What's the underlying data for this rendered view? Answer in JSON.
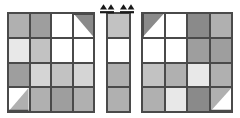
{
  "figure": {
    "background": "#ffffff",
    "line_color": "#4a4a4a",
    "palette": {
      "white": "#ffffff",
      "very_light_gray": "#e8e8e8",
      "light_gray": "#d5d5d5",
      "medium_light_gray": "#c2c2c2",
      "medium_gray": "#b0b0b0",
      "medium_dark_gray": "#9e9e9e",
      "dark_gray": "#8a8a8a"
    }
  },
  "markers": {
    "arrow_left_label": "seam-alignment-arrow",
    "arrow_right_label": "seam-alignment-arrow",
    "count": 2
  },
  "panels": [
    {
      "id": "panel-left",
      "name": "left-block",
      "columns": 4,
      "rows": 4,
      "cells": [
        {
          "fill": "#b0b0b0",
          "shape": "solid"
        },
        {
          "fill": "#9e9e9e",
          "shape": "solid"
        },
        {
          "fill": "#ffffff",
          "shape": "solid"
        },
        {
          "fill": "#ffffff",
          "shape": "triangle-top-right",
          "tri_fill": "#8a8a8a"
        },
        {
          "fill": "#e8e8e8",
          "shape": "solid"
        },
        {
          "fill": "#c2c2c2",
          "shape": "solid"
        },
        {
          "fill": "#ffffff",
          "shape": "solid"
        },
        {
          "fill": "#ffffff",
          "shape": "solid"
        },
        {
          "fill": "#9e9e9e",
          "shape": "solid"
        },
        {
          "fill": "#d5d5d5",
          "shape": "solid"
        },
        {
          "fill": "#c2c2c2",
          "shape": "solid"
        },
        {
          "fill": "#d5d5d5",
          "shape": "solid"
        },
        {
          "fill": "#ffffff",
          "shape": "triangle-bottom-right",
          "tri_fill": "#b0b0b0"
        },
        {
          "fill": "#b0b0b0",
          "shape": "solid"
        },
        {
          "fill": "#9e9e9e",
          "shape": "solid"
        },
        {
          "fill": "#b0b0b0",
          "shape": "solid"
        }
      ]
    },
    {
      "id": "panel-middle",
      "name": "center-sashing-strip",
      "columns": 1,
      "rows": 4,
      "cells": [
        {
          "fill": "#c2c2c2",
          "shape": "solid"
        },
        {
          "fill": "#ffffff",
          "shape": "solid"
        },
        {
          "fill": "#b0b0b0",
          "shape": "solid"
        },
        {
          "fill": "#b0b0b0",
          "shape": "solid"
        }
      ]
    },
    {
      "id": "panel-right",
      "name": "right-block",
      "columns": 4,
      "rows": 4,
      "cells": [
        {
          "fill": "#ffffff",
          "shape": "triangle-top-left",
          "tri_fill": "#8a8a8a"
        },
        {
          "fill": "#ffffff",
          "shape": "solid"
        },
        {
          "fill": "#8a8a8a",
          "shape": "solid"
        },
        {
          "fill": "#b0b0b0",
          "shape": "solid"
        },
        {
          "fill": "#ffffff",
          "shape": "solid"
        },
        {
          "fill": "#ffffff",
          "shape": "solid"
        },
        {
          "fill": "#9e9e9e",
          "shape": "solid"
        },
        {
          "fill": "#9e9e9e",
          "shape": "solid"
        },
        {
          "fill": "#c2c2c2",
          "shape": "solid"
        },
        {
          "fill": "#b0b0b0",
          "shape": "solid"
        },
        {
          "fill": "#e8e8e8",
          "shape": "solid"
        },
        {
          "fill": "#b0b0b0",
          "shape": "solid"
        },
        {
          "fill": "#b0b0b0",
          "shape": "solid"
        },
        {
          "fill": "#e8e8e8",
          "shape": "solid"
        },
        {
          "fill": "#8a8a8a",
          "shape": "solid"
        },
        {
          "fill": "#b0b0b0",
          "shape": "triangle-bottom-right",
          "tri_fill": "#ffffff"
        }
      ]
    }
  ]
}
